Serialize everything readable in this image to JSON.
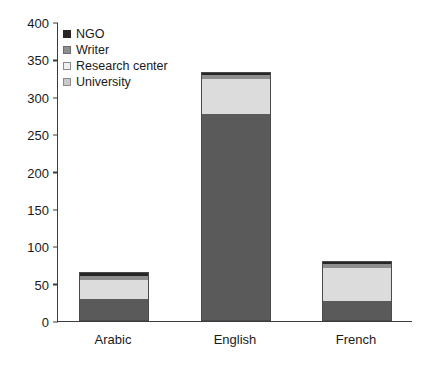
{
  "chart_data": {
    "type": "bar",
    "subtype": "stacked",
    "title": "",
    "xlabel": "",
    "ylabel": "",
    "categories": [
      "Arabic",
      "English",
      "French"
    ],
    "series": [
      {
        "name": "University",
        "values": [
          30,
          277,
          27
        ],
        "color": "#5a5a5a"
      },
      {
        "name": "Research center",
        "values": [
          25,
          47,
          44
        ],
        "color": "#dcdcdc"
      },
      {
        "name": "Writer",
        "values": [
          5,
          5,
          5
        ],
        "color": "#8e8e8e"
      },
      {
        "name": "NGO",
        "values": [
          5,
          4,
          4
        ],
        "color": "#262626"
      }
    ],
    "stack_order_bottom_to_top": [
      "University",
      "Research center",
      "Writer",
      "NGO"
    ],
    "totals": [
      65,
      333,
      80
    ],
    "ylim": [
      0,
      400
    ],
    "yticks": [
      0,
      50,
      100,
      150,
      200,
      250,
      300,
      350,
      400
    ],
    "ytick_labels": [
      "0",
      "50",
      "100",
      "150",
      "200",
      "250",
      "300",
      "350",
      "400"
    ],
    "grid": false,
    "legend_position": "top-left",
    "legend_entries": [
      "NGO",
      "Writer",
      "Research center",
      "University"
    ]
  },
  "legend": {
    "items": [
      {
        "label": "NGO",
        "swatch": "ngo-swatch"
      },
      {
        "label": "Writer",
        "swatch": "writer-swatch"
      },
      {
        "label": "Research center",
        "swatch": "research-center-swatch"
      },
      {
        "label": "University",
        "swatch": "university-swatch"
      }
    ]
  },
  "axes": {
    "y_ticks": [
      "400",
      "350",
      "300",
      "250",
      "200",
      "150",
      "100",
      "50",
      "0"
    ],
    "x_labels": [
      "Arabic",
      "English",
      "French"
    ]
  },
  "colors": {
    "ngo": "#262626",
    "writer": "#8e8e8e",
    "research_center": "#dcdcdc",
    "university": "#5a5a5a",
    "axis": "#3c3c3c",
    "background": "#ffffff"
  }
}
